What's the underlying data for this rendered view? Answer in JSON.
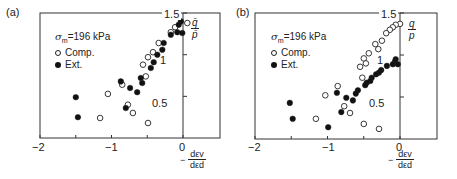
{
  "chart_data": [
    {
      "type": "scatter",
      "panel_label": "(a)",
      "title": "",
      "legend_title": "σm=196 kPa",
      "legend_title_parts": {
        "symbol": "σ",
        "sub": "m",
        "rest": "=196 kPa"
      },
      "xlabel": "-dεv/dεd",
      "xlabel_parts": {
        "minus": "−",
        "num": "dεv",
        "den": "dεd"
      },
      "ylabel": "q/p",
      "ylabel_parts": {
        "num": "q̄",
        "den": "p̄"
      },
      "xlim": [
        -2,
        0.5
      ],
      "ylim": [
        0,
        1.5
      ],
      "x_ticks": [
        {
          "value": -2,
          "label": "−2"
        },
        {
          "value": -1,
          "label": "−1"
        },
        {
          "value": 0,
          "label": "0"
        }
      ],
      "y_ticks": [
        {
          "value": 0.5,
          "label": "0.5"
        },
        {
          "value": 1.0,
          "label": "1"
        },
        {
          "value": 1.5,
          "label": "1.5"
        }
      ],
      "grid": false,
      "legend_position": "upper left",
      "series": [
        {
          "name": "Comp.",
          "marker": "open-circle",
          "points": [
            [
              0.06,
              1.38
            ],
            [
              -0.11,
              1.33
            ],
            [
              -0.17,
              1.27
            ],
            [
              -0.34,
              1.14
            ],
            [
              -0.42,
              1.03
            ],
            [
              -0.49,
              0.97
            ],
            [
              -0.56,
              0.88
            ],
            [
              -0.52,
              0.74
            ],
            [
              -0.85,
              0.64
            ],
            [
              -1.05,
              0.53
            ],
            [
              -0.77,
              0.4
            ],
            [
              -0.7,
              0.3
            ],
            [
              -1.16,
              0.24
            ],
            [
              -0.49,
              0.18
            ]
          ]
        },
        {
          "name": "Ext.",
          "marker": "filled-circle",
          "points": [
            [
              -0.03,
              1.4
            ],
            [
              -0.06,
              1.36
            ],
            [
              -0.08,
              1.27
            ],
            [
              -0.01,
              1.26
            ],
            [
              -0.17,
              1.24
            ],
            [
              -0.27,
              1.14
            ],
            [
              -0.29,
              1.06
            ],
            [
              -0.36,
              1.0
            ],
            [
              -0.41,
              0.91
            ],
            [
              -0.45,
              0.84
            ],
            [
              -0.59,
              0.72
            ],
            [
              -0.57,
              0.66
            ],
            [
              -0.87,
              0.68
            ],
            [
              -0.74,
              0.6
            ],
            [
              -0.64,
              0.55
            ],
            [
              -0.8,
              0.36
            ],
            [
              -1.5,
              0.49
            ],
            [
              -1.47,
              0.25
            ]
          ]
        }
      ]
    },
    {
      "type": "scatter",
      "panel_label": "(b)",
      "title": "",
      "legend_title": "σm=196 kPa",
      "legend_title_parts": {
        "symbol": "σ",
        "sub": "m",
        "rest": "=196 kPa"
      },
      "xlabel": "-dεv/dεd",
      "xlabel_parts": {
        "minus": "−",
        "num": "dεv",
        "den": "dεd"
      },
      "ylabel": "q/p",
      "ylabel_parts": {
        "num": "q",
        "den": "p"
      },
      "xlim": [
        -2,
        0.5
      ],
      "ylim": [
        0,
        1.5
      ],
      "x_ticks": [
        {
          "value": -2,
          "label": "−2"
        },
        {
          "value": -1,
          "label": "−1"
        },
        {
          "value": 0,
          "label": "0"
        }
      ],
      "y_ticks": [
        {
          "value": 0.5,
          "label": "0.5"
        },
        {
          "value": 1.0,
          "label": "1"
        },
        {
          "value": 1.5,
          "label": "1.5"
        }
      ],
      "grid": false,
      "legend_position": "upper left",
      "series": [
        {
          "name": "Comp.",
          "marker": "open-circle",
          "points": [
            [
              0.0,
              1.37
            ],
            [
              -0.06,
              1.36
            ],
            [
              -0.1,
              1.33
            ],
            [
              -0.14,
              1.3
            ],
            [
              -0.19,
              1.26
            ],
            [
              -0.25,
              1.17
            ],
            [
              -0.34,
              1.13
            ],
            [
              -0.3,
              1.07
            ],
            [
              -0.43,
              1.02
            ],
            [
              -0.5,
              0.96
            ],
            [
              -0.47,
              0.9
            ],
            [
              -0.55,
              0.86
            ],
            [
              -0.52,
              0.73
            ],
            [
              -0.86,
              0.63
            ],
            [
              -1.03,
              0.52
            ],
            [
              -0.77,
              0.39
            ],
            [
              -0.69,
              0.31
            ],
            [
              -1.16,
              0.24
            ],
            [
              -0.5,
              0.18
            ],
            [
              -0.29,
              0.12
            ]
          ]
        },
        {
          "name": "Ext.",
          "marker": "filled-circle",
          "points": [
            [
              -0.06,
              0.95
            ],
            [
              -0.07,
              0.92
            ],
            [
              -0.03,
              0.89
            ],
            [
              -0.1,
              0.89
            ],
            [
              -0.18,
              0.87
            ],
            [
              -0.26,
              0.82
            ],
            [
              -0.29,
              0.79
            ],
            [
              -0.33,
              0.77
            ],
            [
              -0.39,
              0.73
            ],
            [
              -0.41,
              0.69
            ],
            [
              -0.46,
              0.67
            ],
            [
              -0.48,
              0.64
            ],
            [
              -0.58,
              0.58
            ],
            [
              -0.61,
              0.54
            ],
            [
              -0.87,
              0.55
            ],
            [
              -0.74,
              0.49
            ],
            [
              -0.65,
              0.46
            ],
            [
              -0.81,
              0.32
            ],
            [
              -1.52,
              0.43
            ],
            [
              -1.48,
              0.24
            ],
            [
              -0.99,
              0.14
            ]
          ]
        }
      ]
    }
  ]
}
